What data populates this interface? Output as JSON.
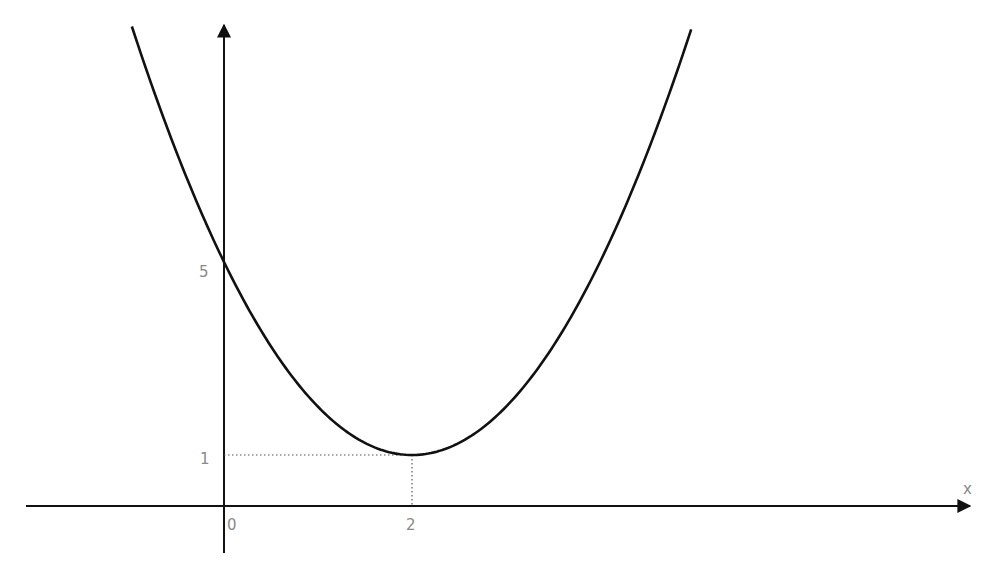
{
  "chart_data": {
    "type": "line",
    "title": "",
    "xlabel": "x",
    "ylabel": "",
    "function": "y = (x - 2)^2 + 1",
    "vertex": {
      "x": 2,
      "y": 1
    },
    "y_intercept": 5,
    "xlim": [
      -2.1,
      8
    ],
    "ylim": [
      -1,
      10
    ],
    "x_ticks": [
      {
        "value": 0,
        "label": "0"
      },
      {
        "value": 2,
        "label": "2"
      }
    ],
    "y_ticks": [
      {
        "value": 1,
        "label": "1"
      },
      {
        "value": 5,
        "label": "5"
      }
    ],
    "series": [
      {
        "name": "parabola",
        "x": [
          -0.98,
          -0.5,
          0,
          0.5,
          1,
          1.5,
          2,
          2.5,
          3,
          3.5,
          4,
          4.5,
          4.97
        ],
        "y": [
          9.88,
          7.25,
          5,
          3.25,
          2,
          1.25,
          1,
          1.25,
          2,
          3.25,
          5,
          7.25,
          9.82
        ],
        "color": "#111111"
      }
    ],
    "guides": [
      {
        "type": "dotted",
        "from": {
          "x": 0,
          "y": 1
        },
        "to": {
          "x": 2,
          "y": 1
        }
      },
      {
        "type": "dotted",
        "from": {
          "x": 2,
          "y": 1
        },
        "to": {
          "x": 2,
          "y": 0
        }
      }
    ],
    "grid": false,
    "legend": "none"
  }
}
